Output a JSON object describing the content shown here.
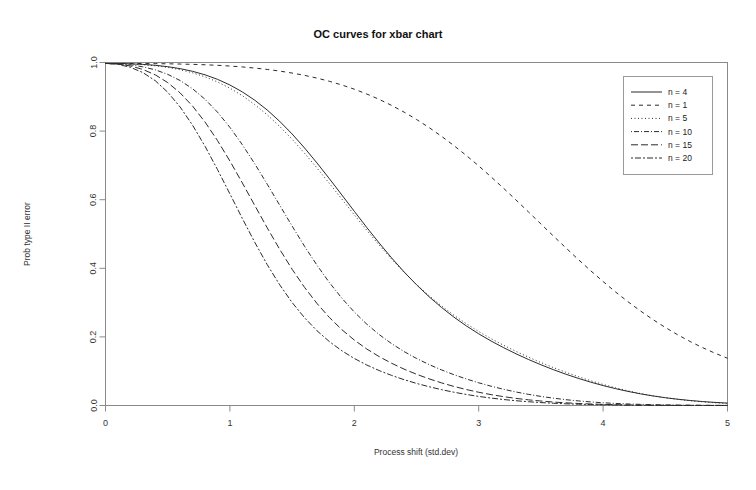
{
  "chart_data": {
    "type": "line",
    "title": "OC curves for xbar chart",
    "xlabel": "Process shift (std.dev)",
    "ylabel": "Prob type II error",
    "xlim": [
      0,
      5
    ],
    "ylim": [
      0,
      1
    ],
    "xticks": [
      "0",
      "1",
      "2",
      "3",
      "4",
      "5"
    ],
    "xtick_values": [
      0,
      1,
      2,
      3,
      4,
      5
    ],
    "yticks": [
      "0.0",
      "0.2",
      "0.4",
      "0.6",
      "0.8",
      "1.0"
    ],
    "ytick_values": [
      0,
      0.2,
      0.4,
      0.6,
      0.8,
      1.0
    ],
    "grid": false,
    "legend_position": "top-right",
    "control_limit_sigma": 3,
    "formula": "beta = Phi(k - delta*sqrt(n)) - Phi(-k - delta*sqrt(n)), k = 3",
    "x": [
      0,
      0.1,
      0.2,
      0.3,
      0.4,
      0.5,
      0.6,
      0.7,
      0.8,
      0.9,
      1.0,
      1.1,
      1.2,
      1.3,
      1.4,
      1.5,
      1.6,
      1.7,
      1.8,
      1.9,
      2.0,
      2.1,
      2.2,
      2.3,
      2.4,
      2.5,
      2.6,
      2.7,
      2.8,
      2.9,
      3.0,
      3.1,
      3.2,
      3.3,
      3.4,
      3.5,
      3.6,
      3.7,
      3.8,
      3.9,
      4.0,
      4.1,
      4.2,
      4.3,
      4.4,
      4.5,
      4.6,
      4.7,
      4.8,
      4.9,
      5.0
    ],
    "series": [
      {
        "name": "n = 4",
        "n": 4,
        "linestyle": "solid",
        "dasharray": "none",
        "values": [
          0.9973,
          0.997,
          0.9961,
          0.9945,
          0.9918,
          0.9878,
          0.9821,
          0.9743,
          0.9641,
          0.951,
          0.9345,
          0.9143,
          0.89,
          0.8614,
          0.8286,
          0.7916,
          0.7509,
          0.7071,
          0.6611,
          0.6138,
          0.5662,
          0.5192,
          0.4737,
          0.4303,
          0.3896,
          0.352,
          0.3175,
          0.2862,
          0.2578,
          0.2322,
          0.209,
          0.1879,
          0.1686,
          0.1507,
          0.1342,
          0.1188,
          0.1045,
          0.0913,
          0.0792,
          0.0681,
          0.0581,
          0.0491,
          0.0411,
          0.034,
          0.0279,
          0.0227,
          0.0183,
          0.0146,
          0.0115,
          0.009,
          0.007
        ]
      },
      {
        "name": "n = 1",
        "n": 1,
        "linestyle": "dashed",
        "dasharray": "4,4",
        "values": [
          0.9973,
          0.9973,
          0.9972,
          0.997,
          0.9967,
          0.9962,
          0.9955,
          0.9946,
          0.9934,
          0.9918,
          0.9897,
          0.9871,
          0.9838,
          0.9798,
          0.975,
          0.9692,
          0.9625,
          0.9545,
          0.9452,
          0.9345,
          0.9222,
          0.9082,
          0.8925,
          0.8749,
          0.8554,
          0.834,
          0.8106,
          0.7852,
          0.758,
          0.729,
          0.6985,
          0.6664,
          0.6332,
          0.5991,
          0.5643,
          0.5293,
          0.4943,
          0.4598,
          0.4259,
          0.393,
          0.3613,
          0.3311,
          0.3025,
          0.2757,
          0.2507,
          0.2275,
          0.2061,
          0.1865,
          0.1686,
          0.1524,
          0.1377
        ]
      },
      {
        "name": "n = 5",
        "n": 5,
        "linestyle": "dotted",
        "dasharray": "1,2.5",
        "values": [
          0.9973,
          0.9969,
          0.9957,
          0.9937,
          0.9904,
          0.9856,
          0.9789,
          0.9699,
          0.9582,
          0.9434,
          0.9252,
          0.9032,
          0.8773,
          0.8474,
          0.8136,
          0.7762,
          0.7356,
          0.6924,
          0.6475,
          0.6017,
          0.5559,
          0.511,
          0.4678,
          0.4268,
          0.3884,
          0.3529,
          0.3203,
          0.2905,
          0.2633,
          0.2385,
          0.2158,
          0.1949,
          0.1756,
          0.1577,
          0.141,
          0.1253,
          0.1106,
          0.0969,
          0.0841,
          0.0723,
          0.0614,
          0.0516,
          0.0428,
          0.035,
          0.0283,
          0.0226,
          0.0178,
          0.0138,
          0.0106,
          0.008,
          0.0059
        ]
      },
      {
        "name": "n = 10",
        "n": 10,
        "linestyle": "dotdash",
        "dasharray": "1,2,5,2",
        "values": [
          0.9973,
          0.9963,
          0.9932,
          0.9875,
          0.9786,
          0.9655,
          0.9474,
          0.9234,
          0.8928,
          0.8553,
          0.8109,
          0.7603,
          0.7046,
          0.6452,
          0.5841,
          0.5232,
          0.4643,
          0.409,
          0.3583,
          0.3128,
          0.2725,
          0.2373,
          0.2068,
          0.1803,
          0.1573,
          0.1372,
          0.1196,
          0.1039,
          0.0899,
          0.0774,
          0.0662,
          0.0562,
          0.0473,
          0.0394,
          0.0325,
          0.0265,
          0.0214,
          0.017,
          0.0134,
          0.0104,
          0.008,
          0.006,
          0.0045,
          0.0033,
          0.0024,
          0.0017,
          0.0012,
          0.0008,
          0.0006,
          0.0004,
          0.0003
        ]
      },
      {
        "name": "n = 15",
        "n": 15,
        "linestyle": "longdash",
        "dasharray": "7,3",
        "values": [
          0.9973,
          0.9955,
          0.9899,
          0.9798,
          0.964,
          0.9415,
          0.9113,
          0.8729,
          0.8264,
          0.7726,
          0.7128,
          0.6489,
          0.5832,
          0.518,
          0.4555,
          0.3973,
          0.3444,
          0.2975,
          0.2565,
          0.2211,
          0.1908,
          0.1648,
          0.1425,
          0.1231,
          0.1061,
          0.0911,
          0.0779,
          0.0661,
          0.0557,
          0.0466,
          0.0386,
          0.0317,
          0.0258,
          0.0207,
          0.0165,
          0.013,
          0.0101,
          0.0078,
          0.0059,
          0.0044,
          0.0033,
          0.0024,
          0.0017,
          0.0012,
          0.0008,
          0.0006,
          0.0004,
          0.0003,
          0.0002,
          0.0001,
          0.0001
        ]
      },
      {
        "name": "n = 20",
        "n": 20,
        "linestyle": "twodash",
        "dasharray": "2,2,6,2",
        "values": [
          0.9973,
          0.9946,
          0.9861,
          0.9707,
          0.9469,
          0.9135,
          0.8702,
          0.8172,
          0.7558,
          0.6881,
          0.617,
          0.5452,
          0.4757,
          0.4107,
          0.352,
          0.3003,
          0.2558,
          0.218,
          0.1862,
          0.1595,
          0.1371,
          0.1181,
          0.1018,
          0.0877,
          0.0753,
          0.0644,
          0.0548,
          0.0463,
          0.0388,
          0.0322,
          0.0265,
          0.0216,
          0.0174,
          0.0139,
          0.011,
          0.0085,
          0.0066,
          0.005,
          0.0038,
          0.0028,
          0.002,
          0.0015,
          0.001,
          0.0007,
          0.0005,
          0.0003,
          0.0002,
          0.0002,
          0.0001,
          0.0001,
          0.0
        ]
      }
    ]
  }
}
